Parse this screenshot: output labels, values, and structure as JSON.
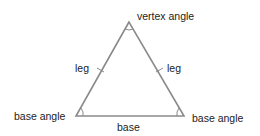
{
  "diagram": {
    "labels": {
      "vertex_angle": "vertex angle",
      "leg_left": "leg",
      "leg_right": "leg",
      "base_angle_left": "base angle",
      "base_angle_right": "base angle",
      "base": "base"
    },
    "colors": {
      "stroke": "#8a8a8a",
      "text": "#222222"
    },
    "vertices": {
      "apex": [
        129,
        22
      ],
      "base_left": [
        76,
        116
      ],
      "base_right": [
        184,
        116
      ]
    }
  }
}
